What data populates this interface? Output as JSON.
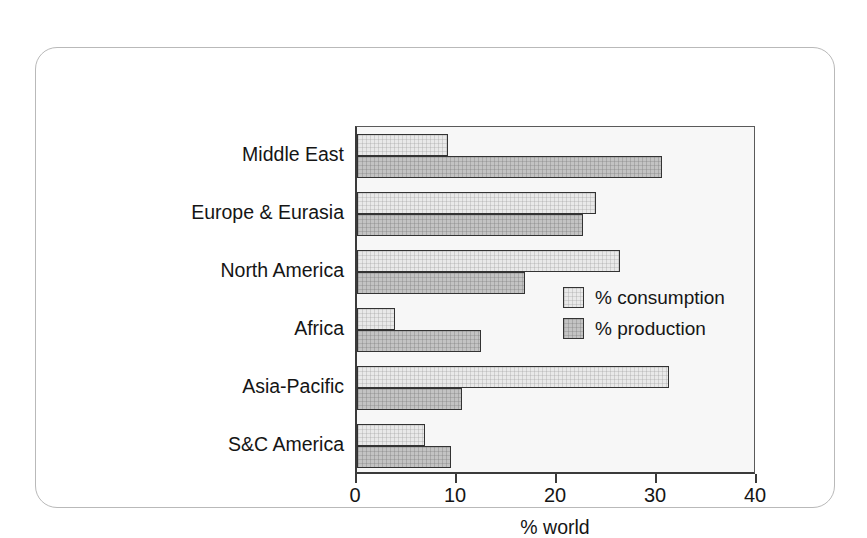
{
  "chart_data": {
    "type": "bar",
    "orientation": "horizontal",
    "title": "",
    "xlabel": "% world",
    "ylabel": "",
    "xlim": [
      0,
      40
    ],
    "xticks": [
      0,
      10,
      20,
      30,
      40
    ],
    "xtick_labels": [
      "0",
      "10",
      "20",
      "30",
      "40"
    ],
    "grid": false,
    "legend_position": "inside-right",
    "categories": [
      "Middle East",
      "Europe & Eurasia",
      "North America",
      "Africa",
      "Asia-Pacific",
      "S&C America"
    ],
    "series": [
      {
        "name": "% consumption",
        "color": "#e9e9e9",
        "values": [
          9.1,
          23.9,
          26.3,
          3.8,
          31.2,
          6.8
        ]
      },
      {
        "name": "% production",
        "color": "#c3c3c3",
        "values": [
          30.5,
          22.6,
          16.8,
          12.4,
          10.5,
          9.4
        ]
      }
    ]
  },
  "legend": {
    "items": [
      {
        "label": "% consumption",
        "key": "consumption"
      },
      {
        "label": "% production",
        "key": "production"
      }
    ]
  },
  "colors": {
    "consumption_fill": "#e9e9e9",
    "production_fill": "#c3c3c3",
    "bar_outline": "#333333",
    "axis": "#3a3a3a",
    "frame_border": "#b9b9b9",
    "plot_background": "#f7f7f7",
    "text": "#151515"
  }
}
